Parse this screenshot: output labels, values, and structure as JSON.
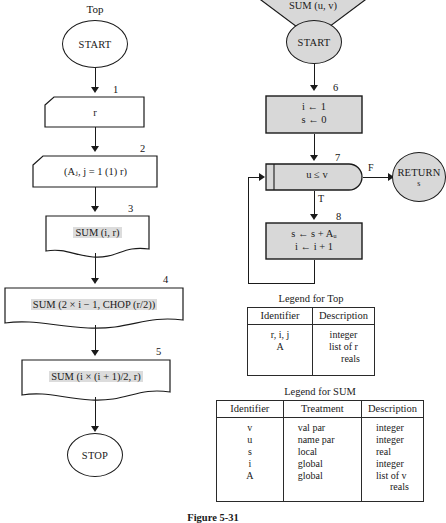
{
  "left_flow": {
    "title": "Top",
    "start_label": "START",
    "stop_label": "STOP",
    "nodes": [
      {
        "num": "1",
        "text": "r",
        "shape": "cut-corner-rect"
      },
      {
        "num": "2",
        "text": "(Aⱼ, j = 1 (1) r)",
        "shape": "cut-corner-rect"
      },
      {
        "num": "3",
        "text": "SUM (i, r)",
        "shape": "document"
      },
      {
        "num": "4",
        "text": "SUM (2 × i − 1, CHOP (r/2))",
        "shape": "document"
      },
      {
        "num": "5",
        "text": "SUM (i × (i + 1)/2, r)",
        "shape": "document"
      }
    ]
  },
  "right_flow": {
    "header": "SUM (u, v)",
    "start_label": "START",
    "return_label": "RETURN",
    "return_sub": "s",
    "branch_true": "T",
    "branch_false": "F",
    "nodes": [
      {
        "num": "6",
        "line1": "i ← 1",
        "line2": "s ← 0",
        "shape": "process"
      },
      {
        "num": "7",
        "text": "u ≤ v",
        "shape": "loop-test"
      },
      {
        "num": "8",
        "line1": "s ← s + Aᵤ",
        "line2": "i ← i + 1",
        "shape": "process"
      }
    ]
  },
  "legend_top": {
    "caption": "Legend for Top",
    "headers": [
      "Identifier",
      "Description"
    ],
    "rows": [
      {
        "identifier": [
          "r, i, j",
          "A"
        ],
        "description": [
          "integer",
          "list of r",
          "reals"
        ]
      }
    ]
  },
  "legend_sum": {
    "caption": "Legend for SUM",
    "headers": [
      "Identifier",
      "Treatment",
      "Description"
    ],
    "rows": [
      {
        "identifier": "v",
        "treatment": "val par",
        "description": "integer"
      },
      {
        "identifier": "u",
        "treatment": "name par",
        "description": "integer"
      },
      {
        "identifier": "s",
        "treatment": "local",
        "description": "real"
      },
      {
        "identifier": "i",
        "treatment": "global",
        "description": "integer"
      },
      {
        "identifier": "A",
        "treatment": "global",
        "description": "list of v"
      },
      {
        "identifier": "",
        "treatment": "",
        "description": "reals"
      }
    ]
  },
  "figure": {
    "caption": "Figure  5-31"
  },
  "colors": {
    "shaded_fill": "#d8d8d8",
    "text_highlight": "#dcdcdc",
    "stroke": "#1a1a1a"
  }
}
